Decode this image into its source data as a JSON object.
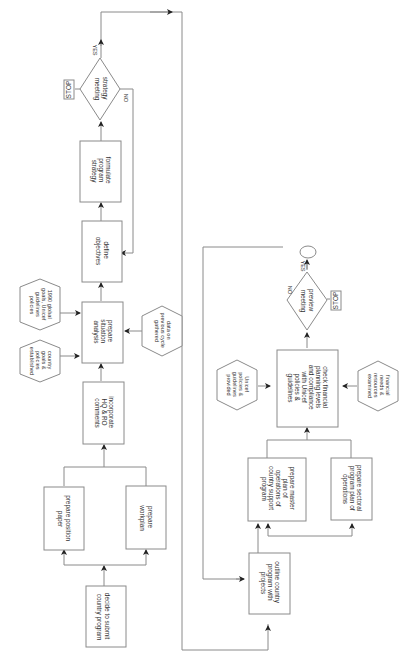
{
  "diagram": {
    "orientation": "rotated 90deg clockwise",
    "nodes": {
      "decide": {
        "lines": [
          "decide to submit",
          "country program"
        ]
      },
      "position_paper": {
        "lines": [
          "prepare position",
          "paper"
        ]
      },
      "workplan": {
        "lines": [
          "prepare",
          "workplan"
        ]
      },
      "incorporate": {
        "lines": [
          "incorporate",
          "HQ & RO",
          "comments"
        ]
      },
      "situation": {
        "lines": [
          "prepare",
          "situation",
          "analysis"
        ]
      },
      "country_goals": {
        "lines": [
          "country",
          "goals &",
          "policies",
          "established"
        ]
      },
      "global_goals": {
        "lines": [
          "1990 global",
          "goals, Unicef",
          "guidelines",
          "policies"
        ]
      },
      "previous_data": {
        "lines": [
          "data on",
          "previous cycle",
          "gathered"
        ]
      },
      "objectives": {
        "lines": [
          "define",
          "objectives"
        ]
      },
      "strategy": {
        "lines": [
          "formulate",
          "program",
          "strategy"
        ]
      },
      "strategy_meeting": {
        "lines": [
          "strategy",
          "meeting"
        ],
        "yes": "YES",
        "no": "NO",
        "stop": "STOP"
      },
      "outline": {
        "lines": [
          "outline country",
          "program with",
          "projects"
        ]
      },
      "master_plan": {
        "lines": [
          "prepare master",
          "plan of",
          "operations of",
          "country support",
          "program"
        ]
      },
      "sectoral": {
        "lines": [
          "prepare sectoral",
          "program plan of",
          "operations"
        ]
      },
      "check_financial": {
        "lines": [
          "check financial",
          "planning levels",
          "and compliance",
          "with Unicef",
          "policies &",
          "guidelines"
        ]
      },
      "unicef_policies": {
        "lines": [
          "Unicef",
          "policies &",
          "guidelines",
          "provided"
        ]
      },
      "financial_needs": {
        "lines": [
          "financial",
          "needs &",
          "resources",
          "examined"
        ]
      },
      "preview_meeting": {
        "lines": [
          "preview",
          "meeting"
        ],
        "yes": "YES",
        "no": "NO",
        "stop": "STOP"
      },
      "end": {
        "lines": []
      }
    }
  }
}
